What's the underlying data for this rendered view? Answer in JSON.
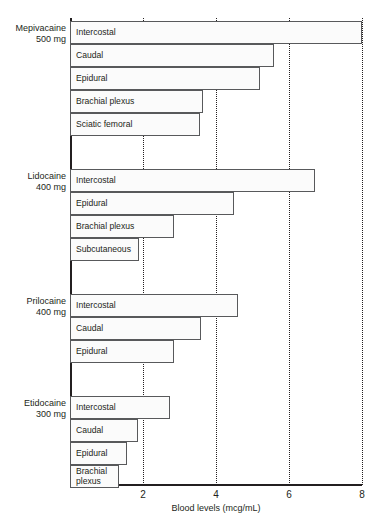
{
  "chart_data": {
    "type": "bar",
    "orientation": "horizontal",
    "title": "",
    "subtitle": "",
    "xlabel": "Blood levels (mcg/mL)",
    "ylabel": "",
    "xlim": [
      0,
      8.05
    ],
    "xticks": [
      2,
      4,
      6,
      8
    ],
    "xtick_labels": [
      "2",
      "4",
      "6",
      "8"
    ],
    "grid": "vertical dotted gridlines at each x tick",
    "legend": "none",
    "value_unit": "mcg/mL",
    "groups": [
      {
        "drug": "Mepivacaine",
        "dose": "500 mg",
        "categories": [
          "Intercostal",
          "Caudal",
          "Epidural",
          "Brachial plexus",
          "Sciatic femoral"
        ],
        "values": [
          8.0,
          5.6,
          5.2,
          3.65,
          3.55
        ]
      },
      {
        "drug": "Lidocaine",
        "dose": "400 mg",
        "categories": [
          "Intercostal",
          "Epidural",
          "Brachial plexus",
          "Subcutaneous"
        ],
        "values": [
          6.7,
          4.5,
          2.85,
          1.9
        ]
      },
      {
        "drug": "Prilocaine",
        "dose": "400 mg",
        "categories": [
          "Intercostal",
          "Caudal",
          "Epidural"
        ],
        "values": [
          4.6,
          3.6,
          2.85
        ]
      },
      {
        "drug": "Etidocaine",
        "dose": "300 mg",
        "categories": [
          "Intercostal",
          "Caudal",
          "Epidural",
          "Brachial\nplexus"
        ],
        "values": [
          2.75,
          1.85,
          1.55,
          1.35
        ]
      }
    ]
  },
  "colors": {
    "ink": "#231f20",
    "bar_border": "#58595b",
    "bar_fill": "#fbfbfb",
    "gridline": "#231f20",
    "background": "#ffffff"
  },
  "axis": {
    "x_title": "Blood levels (mcg/mL)",
    "ticks": [
      {
        "label": "2",
        "value": 2
      },
      {
        "label": "4",
        "value": 4
      },
      {
        "label": "6",
        "value": 6
      },
      {
        "label": "8",
        "value": 8
      }
    ]
  },
  "groups_labels": [
    {
      "drug": "Mepivacaine",
      "dose": "500 mg"
    },
    {
      "drug": "Lidocaine",
      "dose": "400 mg"
    },
    {
      "drug": "Prilocaine",
      "dose": "400 mg"
    },
    {
      "drug": "Etidocaine",
      "dose": "300 mg"
    }
  ]
}
